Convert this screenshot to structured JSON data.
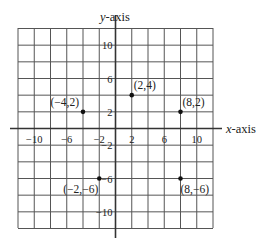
{
  "chart_data": {
    "type": "scatter",
    "title": "",
    "xlabel": "x-axis",
    "ylabel": "y-axis",
    "xlim": [
      -12,
      12
    ],
    "ylim": [
      -12,
      12
    ],
    "grid": true,
    "grid_step": 2,
    "x_ticks": [
      -10,
      -6,
      -2,
      2,
      6,
      10
    ],
    "y_ticks": [
      10,
      6,
      2,
      -2,
      -6,
      -10
    ],
    "x_tick_labels": [
      "−10",
      "−6",
      "−2",
      "2",
      "6",
      "10"
    ],
    "y_tick_labels": [
      "10",
      "6",
      "2",
      "−2",
      "−6",
      "−10"
    ],
    "points": [
      {
        "x": -4,
        "y": 2,
        "label": "(−4,2)"
      },
      {
        "x": 2,
        "y": 4,
        "label": "(2,4)"
      },
      {
        "x": 8,
        "y": 2,
        "label": "(8,2)"
      },
      {
        "x": -2,
        "y": -6,
        "label": "(−2,−6)"
      },
      {
        "x": 8,
        "y": -6,
        "label": "(8,−6)"
      }
    ]
  },
  "axes": {
    "x_label_prefix": "x",
    "x_label_suffix": "-axis",
    "y_label_prefix": "y",
    "y_label_suffix": "-axis"
  }
}
